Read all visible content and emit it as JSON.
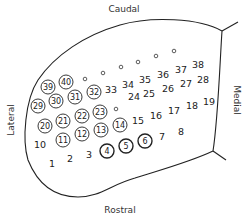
{
  "diagram": {
    "labels": {
      "top": "Caudal",
      "bottom": "Rostral",
      "left": "Lateral",
      "right": "Medial"
    },
    "points": [
      {
        "id": "1",
        "x": 52,
        "y": 163,
        "style": "plain"
      },
      {
        "id": "2",
        "x": 70,
        "y": 158,
        "style": "plain"
      },
      {
        "id": "3",
        "x": 89,
        "y": 154,
        "style": "plain"
      },
      {
        "id": "4",
        "x": 107,
        "y": 151,
        "style": "circled-bold"
      },
      {
        "id": "5",
        "x": 126,
        "y": 146,
        "style": "circled-bold"
      },
      {
        "id": "6",
        "x": 145,
        "y": 141,
        "style": "circled-bold"
      },
      {
        "id": "7",
        "x": 162,
        "y": 136,
        "style": "plain"
      },
      {
        "id": "8",
        "x": 181,
        "y": 131,
        "style": "plain"
      },
      {
        "id": "10",
        "x": 40,
        "y": 144,
        "style": "plain"
      },
      {
        "id": "11",
        "x": 63,
        "y": 140,
        "style": "circled"
      },
      {
        "id": "12",
        "x": 82,
        "y": 134,
        "style": "circled"
      },
      {
        "id": "13",
        "x": 101,
        "y": 130,
        "style": "circled"
      },
      {
        "id": "14",
        "x": 120,
        "y": 125,
        "style": "circled"
      },
      {
        "id": "15",
        "x": 138,
        "y": 120,
        "style": "plain"
      },
      {
        "id": "16",
        "x": 156,
        "y": 115,
        "style": "plain"
      },
      {
        "id": "17",
        "x": 174,
        "y": 110,
        "style": "plain"
      },
      {
        "id": "18",
        "x": 192,
        "y": 105,
        "style": "plain"
      },
      {
        "id": "19",
        "x": 209,
        "y": 101,
        "style": "plain"
      },
      {
        "id": "20",
        "x": 45,
        "y": 126,
        "style": "circled"
      },
      {
        "id": "21",
        "x": 63,
        "y": 121,
        "style": "circled"
      },
      {
        "id": "22",
        "x": 82,
        "y": 116,
        "style": "circled"
      },
      {
        "id": "23",
        "x": 100,
        "y": 112,
        "style": "circled"
      },
      {
        "id": "o1",
        "x": 116,
        "y": 109,
        "style": "dot"
      },
      {
        "id": "24",
        "x": 134,
        "y": 96,
        "style": "plain"
      },
      {
        "id": "25",
        "x": 149,
        "y": 93,
        "style": "plain"
      },
      {
        "id": "26",
        "x": 168,
        "y": 88,
        "style": "plain"
      },
      {
        "id": "27",
        "x": 186,
        "y": 83,
        "style": "plain"
      },
      {
        "id": "28",
        "x": 203,
        "y": 79,
        "style": "plain"
      },
      {
        "id": "29",
        "x": 38,
        "y": 106,
        "style": "circled"
      },
      {
        "id": "30",
        "x": 56,
        "y": 101,
        "style": "circled"
      },
      {
        "id": "31",
        "x": 75,
        "y": 97,
        "style": "circled"
      },
      {
        "id": "32",
        "x": 94,
        "y": 92,
        "style": "circled"
      },
      {
        "id": "33",
        "x": 111,
        "y": 89,
        "style": "plain"
      },
      {
        "id": "34",
        "x": 128,
        "y": 84,
        "style": "plain"
      },
      {
        "id": "35",
        "x": 145,
        "y": 79,
        "style": "plain"
      },
      {
        "id": "36",
        "x": 163,
        "y": 74,
        "style": "plain"
      },
      {
        "id": "37",
        "x": 181,
        "y": 69,
        "style": "plain"
      },
      {
        "id": "38",
        "x": 198,
        "y": 64,
        "style": "plain"
      },
      {
        "id": "39",
        "x": 48,
        "y": 87,
        "style": "circled"
      },
      {
        "id": "40",
        "x": 66,
        "y": 82,
        "style": "circled"
      },
      {
        "id": "o2",
        "x": 85,
        "y": 79,
        "style": "dot"
      },
      {
        "id": "o3",
        "x": 103,
        "y": 73,
        "style": "dot"
      },
      {
        "id": "o4",
        "x": 121,
        "y": 67,
        "style": "dot"
      },
      {
        "id": "o5",
        "x": 138,
        "y": 62,
        "style": "dot"
      },
      {
        "id": "o6",
        "x": 156,
        "y": 56,
        "style": "dot"
      },
      {
        "id": "o7",
        "x": 174,
        "y": 51,
        "style": "dot"
      }
    ]
  }
}
